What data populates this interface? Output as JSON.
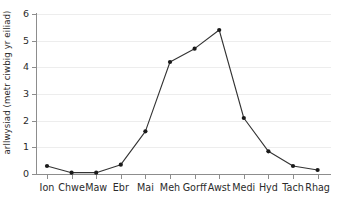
{
  "chart_data": {
    "type": "line",
    "title": "",
    "xlabel": "",
    "ylabel": "arllwysiad (metr ciwbig yr eiliad)",
    "categories": [
      "Ion",
      "Chwe",
      "Maw",
      "Ebr",
      "Mai",
      "Meh",
      "Gorff",
      "Awst",
      "Medi",
      "Hyd",
      "Tach",
      "Rhag"
    ],
    "values": [
      0.3,
      0.05,
      0.05,
      0.35,
      1.6,
      4.2,
      4.7,
      5.4,
      2.1,
      0.85,
      0.3,
      0.15
    ],
    "ylim": [
      0,
      6
    ],
    "ytick_labels": [
      "0",
      "1",
      "2",
      "3",
      "4",
      "5",
      "6"
    ],
    "ytick_values": [
      0,
      1,
      2,
      3,
      4,
      5,
      6
    ],
    "grid": "horizontal",
    "legend": "none",
    "marker": "filled-circle",
    "line_color": "#333333",
    "marker_color": "#1a1a1a",
    "grid_color": "#ededed",
    "axis_color": "#8d8d8d",
    "background_color": "#ffffff"
  }
}
